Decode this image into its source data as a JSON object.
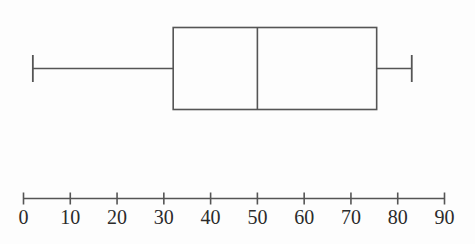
{
  "figure": {
    "type": "boxplot",
    "background_color": "#fdfdfd",
    "line_color": "#555555",
    "text_color": "#2b2b2b"
  },
  "chart_data": {
    "type": "box",
    "title": "",
    "xlabel": "",
    "ylabel": "",
    "orientation": "horizontal",
    "xlim": [
      0,
      90
    ],
    "grid": false,
    "legend": false,
    "xticks": [
      0,
      10,
      20,
      30,
      40,
      50,
      60,
      70,
      80,
      90
    ],
    "xtick_labels": [
      "0",
      "10",
      "20",
      "30",
      "40",
      "50",
      "60",
      "70",
      "80",
      "90"
    ],
    "series": [
      {
        "name": "box-1",
        "min": 2,
        "q1": 32,
        "median": 50,
        "q3": 75.5,
        "max": 83,
        "outliers": []
      }
    ]
  },
  "axis": {
    "line_start_value": 0,
    "line_end_value": 90,
    "tick_labels": [
      "0",
      "10",
      "20",
      "30",
      "40",
      "50",
      "60",
      "70",
      "80",
      "90"
    ]
  }
}
